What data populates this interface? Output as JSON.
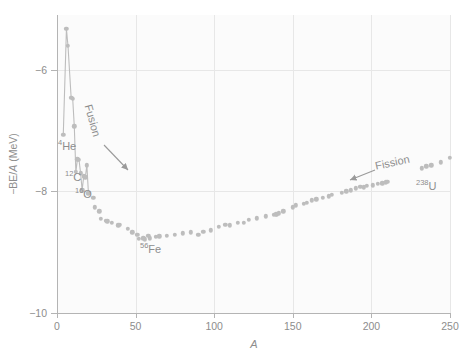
{
  "figure": {
    "background_color": "#ffffff",
    "plot_background_color": "#fbfbfb",
    "marker_color": "#bdbdbd",
    "axis_color": "#b4b4b4",
    "grid_color": "#e7e7e7",
    "text_color": "#8d8d8d"
  },
  "axes": {
    "x_title": "A",
    "y_title_prefix": "−BE/",
    "y_title_italic": "A",
    "y_title_suffix": " (MeV)",
    "y_title_full": "−BE/A (MeV)",
    "x_ticks": [
      "0",
      "50",
      "100",
      "150",
      "200",
      "250"
    ],
    "x_tick_values": [
      0,
      50,
      100,
      150,
      200,
      250
    ],
    "y_ticks": [
      "−6",
      "−8",
      "−10"
    ],
    "y_tick_values": [
      -6,
      -8,
      -10
    ],
    "xlim": [
      0,
      250
    ],
    "ylim": [
      -10,
      -5.1
    ]
  },
  "annotations": {
    "he4": {
      "sup": "4",
      "sym": "He"
    },
    "c12": {
      "sup": "12",
      "sym": "C"
    },
    "o16": {
      "sup": "16",
      "sym": "O"
    },
    "fe56": {
      "sup": "56",
      "sym": "Fe"
    },
    "u238": {
      "sup": "238",
      "sym": "U"
    },
    "fusion": "Fusion",
    "fission": "Fission"
  },
  "chart_data": {
    "type": "scatter",
    "title": "",
    "xlabel": "A",
    "ylabel": "−BE/A (MeV)",
    "xlim": [
      0,
      250
    ],
    "ylim": [
      -10,
      -5.1
    ],
    "grid": true,
    "legend": null,
    "series": [
      {
        "name": "Binding energy per nucleon (negative)",
        "line_for_low_A": true,
        "line_cutoff_A": 20,
        "points": [
          [
            2,
            -1.11
          ],
          [
            3,
            -2.57
          ],
          [
            4,
            -7.07
          ],
          [
            6,
            -5.33
          ],
          [
            7,
            -5.61
          ],
          [
            9,
            -6.46
          ],
          [
            10,
            -6.48
          ],
          [
            11,
            -6.93
          ],
          [
            12,
            -7.68
          ],
          [
            13,
            -7.47
          ],
          [
            14,
            -7.48
          ],
          [
            15,
            -7.7
          ],
          [
            16,
            -7.98
          ],
          [
            17,
            -7.75
          ],
          [
            18,
            -7.77
          ],
          [
            19,
            -7.57
          ],
          [
            20,
            -8.03
          ],
          [
            23,
            -8.11
          ],
          [
            24,
            -8.26
          ],
          [
            27,
            -8.33
          ],
          [
            28,
            -8.45
          ],
          [
            31,
            -8.48
          ],
          [
            32,
            -8.49
          ],
          [
            35,
            -8.52
          ],
          [
            39,
            -8.56
          ],
          [
            40,
            -8.55
          ],
          [
            45,
            -8.62
          ],
          [
            48,
            -8.67
          ],
          [
            51,
            -8.71
          ],
          [
            52,
            -8.78
          ],
          [
            55,
            -8.77
          ],
          [
            56,
            -8.79
          ],
          [
            59,
            -8.77
          ],
          [
            58,
            -8.73
          ],
          [
            63,
            -8.75
          ],
          [
            65,
            -8.74
          ],
          [
            70,
            -8.73
          ],
          [
            75,
            -8.71
          ],
          [
            80,
            -8.69
          ],
          [
            85,
            -8.67
          ],
          [
            90,
            -8.71
          ],
          [
            93,
            -8.66
          ],
          [
            98,
            -8.64
          ],
          [
            103,
            -8.58
          ],
          [
            107,
            -8.55
          ],
          [
            110,
            -8.56
          ],
          [
            115,
            -8.52
          ],
          [
            119,
            -8.52
          ],
          [
            122,
            -8.47
          ],
          [
            127,
            -8.44
          ],
          [
            133,
            -8.41
          ],
          [
            138,
            -8.39
          ],
          [
            139,
            -8.38
          ],
          [
            140,
            -8.38
          ],
          [
            141,
            -8.36
          ],
          [
            144,
            -8.33
          ],
          [
            150,
            -8.26
          ],
          [
            152,
            -8.23
          ],
          [
            157,
            -8.2
          ],
          [
            159,
            -8.19
          ],
          [
            162,
            -8.15
          ],
          [
            165,
            -8.13
          ],
          [
            169,
            -8.11
          ],
          [
            173,
            -8.08
          ],
          [
            175,
            -8.06
          ],
          [
            181,
            -8.02
          ],
          [
            184,
            -8.0
          ],
          [
            187,
            -7.98
          ],
          [
            190,
            -7.95
          ],
          [
            193,
            -7.92
          ],
          [
            195,
            -7.93
          ],
          [
            197,
            -7.91
          ],
          [
            201,
            -7.9
          ],
          [
            204,
            -7.88
          ],
          [
            207,
            -7.87
          ],
          [
            209,
            -7.85
          ],
          [
            210,
            -7.84
          ],
          [
            232,
            -7.62
          ],
          [
            235,
            -7.59
          ],
          [
            238,
            -7.57
          ],
          [
            244,
            -7.52
          ],
          [
            250,
            -7.45
          ]
        ]
      }
    ]
  }
}
